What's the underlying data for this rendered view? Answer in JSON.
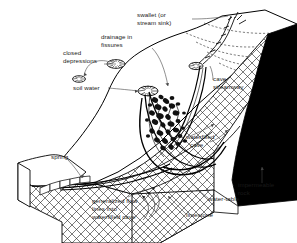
{
  "figure": {
    "type": "geological-block-diagram",
    "background_color": "#ffffff",
    "line_color": "#000000"
  },
  "labels": {
    "swallet": {
      "line1": "swallet (or",
      "line2": "stream sink)"
    },
    "drainage_fissures": {
      "line1": "drainage in",
      "line2": "fissures"
    },
    "closed_depressions": {
      "line1": "closed",
      "line2": "depressions"
    },
    "soil_water": {
      "line1": "soil water"
    },
    "cave_streamway": {
      "line1": "cave",
      "line2": "streamway"
    },
    "waterfilled_cave": {
      "line1": "waterfilled",
      "line2": "cave"
    },
    "impermeable_rock": {
      "line1": "impermeable",
      "line2": "rock"
    },
    "water_table": {
      "line1": "water-table"
    },
    "limestone": {
      "line1": "limestone"
    },
    "spring": {
      "line1": "spring"
    },
    "flow_lines": {
      "line1": "generalized flow",
      "line2": "lines into",
      "line3": "waterfilled cave"
    }
  },
  "features": {
    "limestone_fill": "cross-hatch",
    "impermeable_fill": "solid-black",
    "surface_fill": "white",
    "contour_style": "dashed"
  }
}
